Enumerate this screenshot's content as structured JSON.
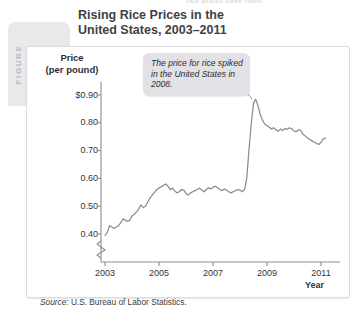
{
  "runhead": "rice prices have risen",
  "figure": {
    "word": "FIGURE",
    "number": "7-4"
  },
  "title": "Rising Rice Prices in the\nUnited States, 2003–2011",
  "title_line1": "Rising Rice Prices in the",
  "title_line2": "United States, 2003–2011",
  "axis_title_line1": "Price",
  "axis_title_line2": "(per pound)",
  "year_label": "Year",
  "annotation": "The price for rice spiked in the United States in 2008.",
  "source": "Source:",
  "source_text": " U.S. Bureau of Labor Statistics.",
  "colors": {
    "line": "#8b8b92",
    "axis": "#8d8d94",
    "callout_bg": "#e2e2e6",
    "figtab_bg": "#e9e9ec",
    "text": "#34343a",
    "panel_border": "#dcdce0"
  },
  "chart_data": {
    "type": "line",
    "title": "Rising Rice Prices in the United States, 2003–2011",
    "xlabel": "Year",
    "ylabel": "Price (per pound)",
    "xlim": [
      2003,
      2011.5
    ],
    "ylim": [
      0.36,
      0.93
    ],
    "yticks": [
      "$0.90",
      "0.80",
      "0.70",
      "0.60",
      "0.50",
      "0.40"
    ],
    "ytick_values": [
      0.9,
      0.8,
      0.7,
      0.6,
      0.5,
      0.4
    ],
    "xticks": [
      "2003",
      "2005",
      "2007",
      "2009",
      "2011"
    ],
    "xtick_values": [
      2003,
      2005,
      2007,
      2009,
      2011
    ],
    "grid": false,
    "legend": null,
    "axis_break": true,
    "annotations": [
      {
        "text": "The price for rice spiked in the United States in 2008.",
        "points_to_x": 2008.45,
        "points_to_y": 0.885
      }
    ],
    "series": [
      {
        "name": "Rice price per pound",
        "x": [
          2003.0,
          2003.08,
          2003.17,
          2003.25,
          2003.33,
          2003.42,
          2003.5,
          2003.58,
          2003.67,
          2003.75,
          2003.83,
          2003.92,
          2004.0,
          2004.08,
          2004.17,
          2004.25,
          2004.33,
          2004.42,
          2004.5,
          2004.58,
          2004.67,
          2004.75,
          2004.83,
          2004.92,
          2005.0,
          2005.08,
          2005.17,
          2005.25,
          2005.33,
          2005.42,
          2005.5,
          2005.58,
          2005.67,
          2005.75,
          2005.83,
          2005.92,
          2006.0,
          2006.08,
          2006.17,
          2006.25,
          2006.33,
          2006.42,
          2006.5,
          2006.58,
          2006.67,
          2006.75,
          2006.83,
          2006.92,
          2007.0,
          2007.08,
          2007.17,
          2007.25,
          2007.33,
          2007.42,
          2007.5,
          2007.58,
          2007.67,
          2007.75,
          2007.83,
          2007.92,
          2008.0,
          2008.08,
          2008.17,
          2008.25,
          2008.33,
          2008.42,
          2008.5,
          2008.58,
          2008.67,
          2008.75,
          2008.83,
          2008.92,
          2009.0,
          2009.08,
          2009.17,
          2009.25,
          2009.33,
          2009.42,
          2009.5,
          2009.58,
          2009.67,
          2009.75,
          2009.83,
          2009.92,
          2010.0,
          2010.08,
          2010.17,
          2010.25,
          2010.33,
          2010.42,
          2010.5,
          2010.58,
          2010.67,
          2010.75,
          2010.83,
          2010.92,
          2011.0,
          2011.08,
          2011.17
        ],
        "y": [
          0.395,
          0.405,
          0.43,
          0.425,
          0.42,
          0.425,
          0.43,
          0.44,
          0.455,
          0.45,
          0.445,
          0.45,
          0.465,
          0.47,
          0.48,
          0.49,
          0.505,
          0.495,
          0.5,
          0.515,
          0.53,
          0.54,
          0.55,
          0.56,
          0.565,
          0.57,
          0.575,
          0.58,
          0.572,
          0.56,
          0.565,
          0.555,
          0.548,
          0.552,
          0.56,
          0.558,
          0.545,
          0.54,
          0.548,
          0.552,
          0.556,
          0.56,
          0.565,
          0.558,
          0.552,
          0.56,
          0.566,
          0.562,
          0.568,
          0.572,
          0.566,
          0.56,
          0.556,
          0.562,
          0.558,
          0.552,
          0.548,
          0.552,
          0.556,
          0.56,
          0.558,
          0.552,
          0.56,
          0.6,
          0.7,
          0.8,
          0.87,
          0.885,
          0.86,
          0.83,
          0.81,
          0.795,
          0.79,
          0.785,
          0.778,
          0.782,
          0.775,
          0.77,
          0.778,
          0.772,
          0.78,
          0.776,
          0.782,
          0.778,
          0.77,
          0.768,
          0.775,
          0.772,
          0.76,
          0.752,
          0.745,
          0.74,
          0.735,
          0.73,
          0.726,
          0.722,
          0.73,
          0.742,
          0.745
        ]
      }
    ]
  }
}
